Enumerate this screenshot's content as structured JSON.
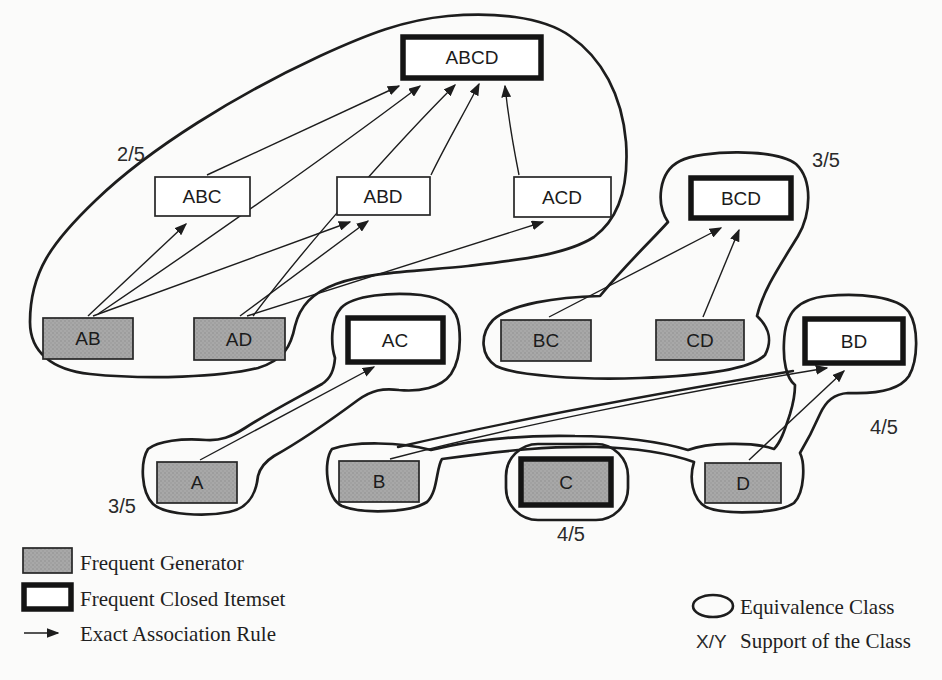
{
  "figure": {
    "nodes": {
      "ABCD": {
        "label": "ABCD",
        "role": "frequent-closed-itemset"
      },
      "ABC": {
        "label": "ABC",
        "role": "frequent-itemset"
      },
      "ABD": {
        "label": "ABD",
        "role": "frequent-itemset"
      },
      "ACD": {
        "label": "ACD",
        "role": "frequent-itemset"
      },
      "BCD": {
        "label": "BCD",
        "role": "frequent-closed-itemset"
      },
      "AB": {
        "label": "AB",
        "role": "frequent-generator"
      },
      "AD": {
        "label": "AD",
        "role": "frequent-generator"
      },
      "AC": {
        "label": "AC",
        "role": "frequent-closed-itemset"
      },
      "BC": {
        "label": "BC",
        "role": "frequent-generator"
      },
      "CD": {
        "label": "CD",
        "role": "frequent-generator"
      },
      "BD": {
        "label": "BD",
        "role": "frequent-closed-itemset"
      },
      "A": {
        "label": "A",
        "role": "frequent-generator"
      },
      "B": {
        "label": "B",
        "role": "frequent-generator"
      },
      "C": {
        "label": "C",
        "role": "frequent-generator-and-closed-itemset"
      },
      "D": {
        "label": "D",
        "role": "frequent-generator"
      }
    },
    "classes": [
      {
        "members": [
          "AB",
          "AD",
          "ABC",
          "ABD",
          "ACD",
          "ABCD"
        ],
        "support": "2/5"
      },
      {
        "members": [
          "A",
          "AC"
        ],
        "support": "3/5"
      },
      {
        "members": [
          "BC",
          "CD",
          "BCD"
        ],
        "support": "3/5"
      },
      {
        "members": [
          "B",
          "D",
          "BD"
        ],
        "support": "4/5"
      },
      {
        "members": [
          "C"
        ],
        "support": "4/5"
      }
    ],
    "rules": [
      {
        "from": "AB",
        "to": "ABC"
      },
      {
        "from": "AB",
        "to": "ABD"
      },
      {
        "from": "AB",
        "to": "ABCD"
      },
      {
        "from": "AD",
        "to": "ABD"
      },
      {
        "from": "AD",
        "to": "ACD"
      },
      {
        "from": "AD",
        "to": "ABCD"
      },
      {
        "from": "ABC",
        "to": "ABCD"
      },
      {
        "from": "ABD",
        "to": "ABCD"
      },
      {
        "from": "ACD",
        "to": "ABCD"
      },
      {
        "from": "BC",
        "to": "BCD"
      },
      {
        "from": "CD",
        "to": "BCD"
      },
      {
        "from": "A",
        "to": "AC"
      },
      {
        "from": "B",
        "to": "BD"
      },
      {
        "from": "D",
        "to": "BD"
      }
    ]
  },
  "legend": {
    "frequent_generator": "Frequent Generator",
    "frequent_closed_itemset": "Frequent Closed Itemset",
    "exact_association_rule": "Exact Association Rule",
    "equivalence_class": "Equivalence Class",
    "support_symbol": "X/Y",
    "support_of_class": "Support of the Class"
  },
  "colors": {
    "paper": "#fbfbfa",
    "line": "#1d1d1d",
    "generator_fill": "#a8a8a8",
    "closed_border": "#141414"
  }
}
